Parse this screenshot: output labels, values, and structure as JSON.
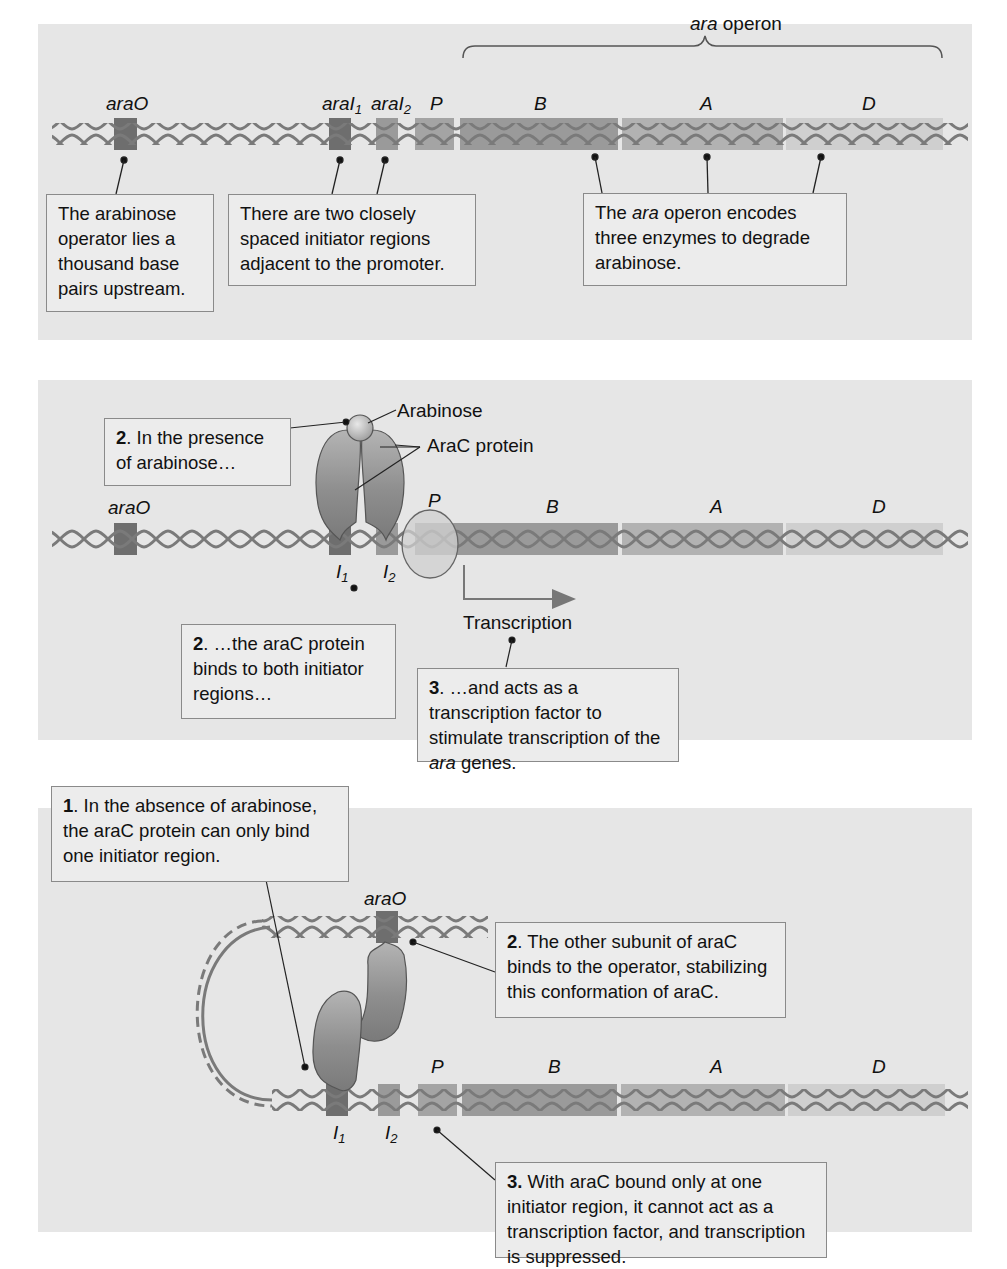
{
  "figure": {
    "colors": {
      "panel_bg": "#e6e6e6",
      "callout_bg": "#ececec",
      "callout_border": "#8a8a8a",
      "dna_strand": "#7a7a7a",
      "operator": "#6e6e6e",
      "initiator1": "#6e6e6e",
      "initiator2": "#9a9a9a",
      "promoter": "#a4a4a4",
      "gene_B": "#9a9a9a",
      "gene_A": "#b2b2b2",
      "gene_D": "#cfcfcf",
      "protein": "#8f8f8f"
    }
  },
  "panel1": {
    "brace_label_italic": "ara",
    "brace_label_rest": " operon",
    "labels": {
      "operator": "araO",
      "initiator1_prefix": "araI",
      "initiator1_sub": "1",
      "initiator2_prefix": "araI",
      "initiator2_sub": "2",
      "promoter": "P",
      "gene_B": "B",
      "gene_A": "A",
      "gene_D": "D"
    },
    "callouts": {
      "operator": "The arabinose operator lies a thousand base pairs upstream.",
      "initiators": "There are two closely spaced initiator regions adjacent to the promoter.",
      "operon_pre": "The ",
      "operon_italic": "ara",
      "operon_post": " operon encodes three enzymes to degrade arabinose."
    }
  },
  "panel2": {
    "labels": {
      "arabinose": "Arabinose",
      "arac_protein": "AraC protein",
      "operator": "araO",
      "promoter": "P",
      "gene_B": "B",
      "gene_A": "A",
      "gene_D": "D",
      "i1_prefix": "I",
      "i1_sub": "1",
      "i2_prefix": "I",
      "i2_sub": "2",
      "transcription": "Transcription"
    },
    "callouts": {
      "presence_num": "2",
      "presence_text": ". In the presence of arabinose…",
      "binds_num": "2",
      "binds_text": ". …the araC protein binds to both initiator regions…",
      "acts_num": "3",
      "acts_pre": ". …and acts as a transcription factor to stimulate transcription of the ",
      "acts_italic": "ara",
      "acts_post": " genes."
    }
  },
  "panel3": {
    "labels": {
      "operator": "araO",
      "promoter": "P",
      "gene_B": "B",
      "gene_A": "A",
      "gene_D": "D",
      "i1_prefix": "I",
      "i1_sub": "1",
      "i2_prefix": "I",
      "i2_sub": "2"
    },
    "callouts": {
      "absence_num": "1",
      "absence_text": ". In the absence of arabinose, the araC protein can only bind one initiator region.",
      "other_num": "2",
      "other_text": ". The other subunit of araC binds to the operator, stabilizing this conformation of araC.",
      "suppressed_num": "3.",
      "suppressed_text": " With araC bound only at one initiator region, it cannot act as a transcription factor, and transcription is suppressed."
    }
  }
}
